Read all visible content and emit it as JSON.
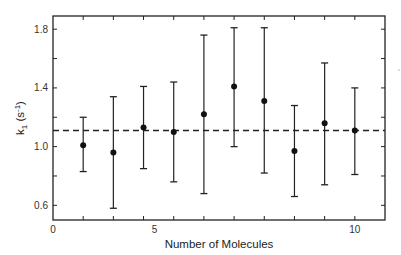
{
  "chart_data": {
    "type": "scatter",
    "title": "",
    "xlabel": "Number of Molecules",
    "ylabel": "k1 (s^-1)",
    "ylabel_parts": {
      "k": "k",
      "sub": "1",
      "unit_open": " (s",
      "sup": "-1",
      "unit_close": ")"
    },
    "xlim": [
      0,
      11
    ],
    "ylim": [
      0.5,
      1.89
    ],
    "x_tick_labels": [
      {
        "label": "0",
        "pos": 0
      },
      {
        "label": "5",
        "pos": 3.2
      },
      {
        "label": "10",
        "pos": 10
      }
    ],
    "x_minor_ticks": [
      1,
      2,
      3,
      4,
      5,
      6,
      7,
      8,
      9,
      10
    ],
    "y_ticks": [
      0.6,
      0.8,
      1.0,
      1.2,
      1.4,
      1.6,
      1.8
    ],
    "y_tick_labels": [
      {
        "label": "0.6",
        "value": 0.6
      },
      {
        "label": "1.0",
        "value": 1.0
      },
      {
        "label": "1.4",
        "value": 1.4
      },
      {
        "label": "1.8",
        "value": 1.8
      }
    ],
    "grid": false,
    "series": [
      {
        "name": "k1",
        "marker": "filled-circle",
        "color": "#111111",
        "points": [
          {
            "x": 1,
            "y": 1.01,
            "low": 0.83,
            "high": 1.2
          },
          {
            "x": 2,
            "y": 0.96,
            "low": 0.58,
            "high": 1.34
          },
          {
            "x": 3,
            "y": 1.13,
            "low": 0.85,
            "high": 1.41
          },
          {
            "x": 4,
            "y": 1.1,
            "low": 0.76,
            "high": 1.44
          },
          {
            "x": 5,
            "y": 1.22,
            "low": 0.68,
            "high": 1.76
          },
          {
            "x": 6,
            "y": 1.41,
            "low": 1.0,
            "high": 1.81
          },
          {
            "x": 7,
            "y": 1.31,
            "low": 0.82,
            "high": 1.81
          },
          {
            "x": 8,
            "y": 0.97,
            "low": 0.66,
            "high": 1.28
          },
          {
            "x": 9,
            "y": 1.16,
            "low": 0.74,
            "high": 1.57
          },
          {
            "x": 10,
            "y": 1.11,
            "low": 0.81,
            "high": 1.4
          }
        ]
      }
    ],
    "reference_line": {
      "y": 1.11,
      "style": "dashed",
      "color": "#222222"
    }
  }
}
